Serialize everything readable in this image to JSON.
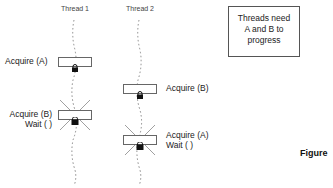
{
  "diagram": {
    "threads": [
      {
        "label": "Thread 1"
      },
      {
        "label": "Thread 2"
      }
    ],
    "steps": [
      {
        "thread": "Thread 1",
        "label": "Acquire (A)",
        "blocked": false
      },
      {
        "thread": "Thread 2",
        "label": "Acquire (B)",
        "blocked": false
      },
      {
        "thread": "Thread 1",
        "label_line1": "Acquire (B)",
        "label_line2": "Wait ( )",
        "blocked": true
      },
      {
        "thread": "Thread 2",
        "label_line1": "Acquire (A)",
        "label_line2": "Wait ( )",
        "blocked": true
      }
    ],
    "note": {
      "line1": "Threads need",
      "line2": "A and B to",
      "line3": "progress"
    },
    "caption": "Figure",
    "colors": {
      "line": "#888888",
      "box_border": "#666666",
      "lock": "#111111"
    },
    "icons": [
      "lock-icon",
      "blocked-cross-icon"
    ]
  }
}
